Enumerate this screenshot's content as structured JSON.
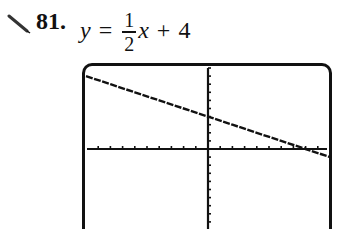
{
  "exercise": {
    "number": "81.",
    "equation": {
      "lhs": "y",
      "equals": "=",
      "fraction_numerator": "1",
      "fraction_denominator": "2",
      "variable": "x",
      "plus": "+",
      "constant": "4"
    },
    "icon": "pencil-icon"
  },
  "chart_data": {
    "type": "line",
    "xlabel": "",
    "ylabel": "",
    "xlim": [
      -10,
      10
    ],
    "ylim": [
      -10,
      10
    ],
    "grid": false,
    "axis_ticks": {
      "x_step": 1,
      "y_step": 1
    },
    "series": [
      {
        "name": "graph",
        "x": [
          -10,
          -8,
          -6,
          -4,
          -2,
          0,
          2,
          4,
          6,
          8,
          10
        ],
        "y": [
          9,
          8,
          7,
          6,
          5,
          4,
          3,
          2,
          1,
          0,
          -1
        ]
      }
    ],
    "annotations": []
  },
  "colors": {
    "ink": "#111111",
    "background": "#ffffff"
  }
}
